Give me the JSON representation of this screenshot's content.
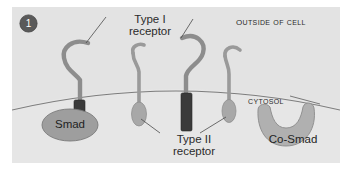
{
  "figure": {
    "panel_number": "1",
    "background_color": "#e3e3e3",
    "outline_color": "#8a8a8a"
  },
  "labels": {
    "outside_of_cell": "Outside of Cell",
    "cytosol": "Cytosol",
    "type1_receptor": "Type I receptor",
    "type1_receptor_line1": "Type I",
    "type1_receptor_line2": "receptor",
    "type2_receptor": "Type II receptor",
    "type2_receptor_line1": "Type II",
    "type2_receptor_line2": "receptor",
    "smad": "Smad",
    "co_smad": "Co-Smad"
  },
  "colors": {
    "panel_fill": "#e3e3e3",
    "receptor_stem": "#8f8f8f",
    "kinase_domain_dark": "#3a3a3a",
    "type2_bulb": "#a8a8a8",
    "smad_fill": "#9e9e9e",
    "co_smad_fill": "#b0b0b0",
    "membrane_line": "#7d7d7d",
    "leader_line": "#4a4a4a",
    "badge_fill": "#5a5a5a",
    "text": "#2b2b2b"
  },
  "diagram": {
    "type": "cell-signaling-schematic",
    "membrane": {
      "description": "curved plasma membrane arc dividing extracellular space from cytosol",
      "apex_y": 84,
      "edge_y": 108
    },
    "receptors": [
      {
        "name": "type-1-receptor-left",
        "kind": "Type I",
        "stem_x": 80,
        "cytoplasmic_domain": "dark-rectangle"
      },
      {
        "name": "type-2-receptor-left",
        "kind": "Type II",
        "stem_x": 139,
        "cytoplasmic_domain": "gray-ellipse"
      },
      {
        "name": "type-1-receptor-right",
        "kind": "Type I",
        "stem_x": 186,
        "cytoplasmic_domain": "dark-rectangle"
      },
      {
        "name": "type-2-receptor-right",
        "kind": "Type II",
        "stem_x": 228,
        "cytoplasmic_domain": "gray-ellipse"
      }
    ],
    "cytosolic_proteins": [
      {
        "name": "smad",
        "shape": "ellipse",
        "cx": 70,
        "cy": 124
      },
      {
        "name": "co-smad",
        "shape": "crescent",
        "cx": 293,
        "cy": 126
      }
    ]
  }
}
